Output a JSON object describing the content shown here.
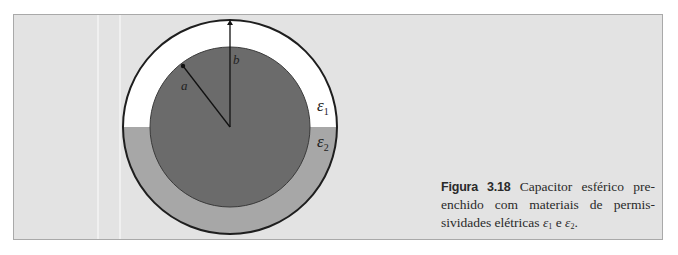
{
  "figure": {
    "labels": {
      "inner_radius": "a",
      "outer_radius": "b",
      "eps_symbol": "ε",
      "eps1_sub": "1",
      "eps2_sub": "2"
    },
    "colors": {
      "panel_bg": "#e3e3e3",
      "upper_dielectric": "#ffffff",
      "lower_dielectric": "#a7a7a7",
      "inner_conductor": "#6b6b6b",
      "outline": "#1e1e1e"
    }
  },
  "caption": {
    "figure_number": "Figura 3.18",
    "text_part1": " Capacitor esférico pre­enchido com materiais de permis­sividades elétricas ",
    "eps_symbol": "ε",
    "eps1_sub": "1",
    "conjunction": " e ",
    "eps2_sub": "2",
    "end": "."
  }
}
